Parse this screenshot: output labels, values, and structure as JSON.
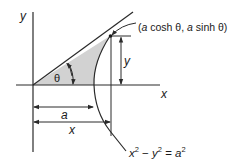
{
  "figure": {
    "type": "hyperbola-geometry",
    "labels": {
      "y_axis": "y",
      "x_axis": "x",
      "theta": "θ",
      "point": "(a cosh θ, a sinh θ)",
      "y_dimension": "y",
      "a_dimension": "a",
      "x_dimension": "x",
      "equation": "x² − y² = a²"
    },
    "point_label_parts": {
      "open": "(",
      "a1": "a",
      "cosh": " cosh θ, ",
      "a2": "a",
      "sinh": " sinh θ)"
    },
    "equation_parts": {
      "x": "x",
      "x_exp": "2",
      "minus": " − ",
      "y": "y",
      "y_exp": "2",
      "eq": " = ",
      "a": "a",
      "a_exp": "2"
    },
    "colors": {
      "line": "#2a2a2a",
      "shade": "#d2d2d2",
      "background": "#ffffff"
    }
  }
}
